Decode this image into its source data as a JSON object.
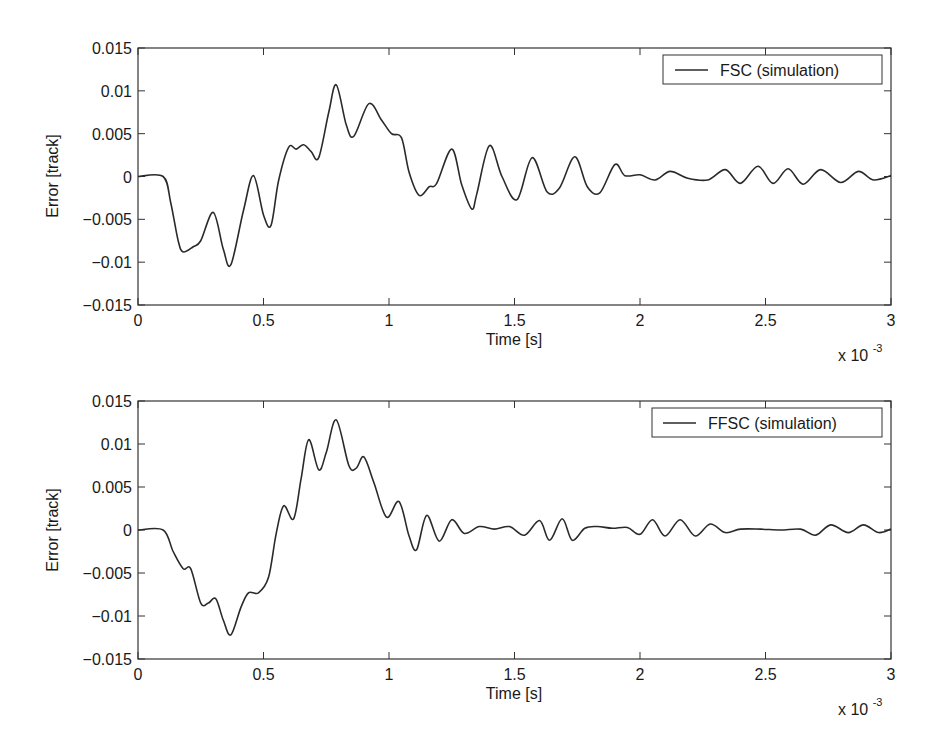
{
  "figure": {
    "background": "#ffffff",
    "line_color": "#2a2a2a",
    "axis_color": "#333333"
  },
  "chart_data": [
    {
      "type": "line",
      "title": "",
      "xlabel": "Time [s]",
      "ylabel": "Error [track]",
      "x_multiplier_label": "x 10",
      "x_multiplier_exp": "-3",
      "xlim": [
        0,
        3
      ],
      "ylim": [
        -0.015,
        0.015
      ],
      "xticks": [
        0,
        0.5,
        1,
        1.5,
        2,
        2.5,
        3
      ],
      "xtick_labels": [
        "0",
        "0.5",
        "1",
        "1.5",
        "2",
        "2.5",
        "3"
      ],
      "yticks": [
        0.015,
        0.01,
        0.005,
        0,
        -0.005,
        -0.01,
        -0.015
      ],
      "ytick_labels": [
        "0.015",
        "0.01",
        "0.005",
        "0",
        "−0.005",
        "−0.01",
        "−0.015"
      ],
      "grid": false,
      "legend_position": "upper right",
      "series": [
        {
          "name": "FSC (simulation)",
          "x": [
            0,
            0.1,
            0.13,
            0.16,
            0.18,
            0.22,
            0.25,
            0.3,
            0.34,
            0.37,
            0.42,
            0.46,
            0.5,
            0.53,
            0.56,
            0.6,
            0.63,
            0.66,
            0.69,
            0.72,
            0.76,
            0.79,
            0.83,
            0.86,
            0.92,
            0.97,
            1.01,
            1.05,
            1.08,
            1.12,
            1.16,
            1.19,
            1.25,
            1.29,
            1.33,
            1.35,
            1.4,
            1.45,
            1.51,
            1.57,
            1.63,
            1.68,
            1.74,
            1.79,
            1.84,
            1.9,
            1.94,
            2.0,
            2.06,
            2.12,
            2.19,
            2.27,
            2.34,
            2.4,
            2.47,
            2.53,
            2.59,
            2.65,
            2.72,
            2.8,
            2.87,
            2.93,
            3.0
          ],
          "y": [
            0,
            0,
            -0.003,
            -0.0075,
            -0.0088,
            -0.0082,
            -0.0075,
            -0.0042,
            -0.0085,
            -0.0103,
            -0.004,
            0.0001,
            -0.0045,
            -0.0057,
            -0.0005,
            0.0034,
            0.0032,
            0.0037,
            0.0029,
            0.0022,
            0.0075,
            0.0107,
            0.006,
            0.0047,
            0.0085,
            0.0066,
            0.005,
            0.0045,
            0.0005,
            -0.0022,
            -0.0012,
            -0.0008,
            0.0032,
            -0.001,
            -0.0038,
            -0.002,
            0.0036,
            0.0,
            -0.0027,
            0.0022,
            -0.0018,
            -0.0013,
            0.0023,
            -0.0012,
            -0.0019,
            0.0014,
            0.0001,
            0.0002,
            -0.0004,
            0.0006,
            -0.0002,
            -0.0004,
            0.0008,
            -0.0008,
            0.0012,
            -0.0008,
            0.0009,
            -0.0009,
            0.0008,
            -0.0007,
            0.0006,
            -0.0004,
            0.0001
          ]
        }
      ]
    },
    {
      "type": "line",
      "title": "",
      "xlabel": "Time [s]",
      "ylabel": "Error [track]",
      "x_multiplier_label": "x 10",
      "x_multiplier_exp": "-3",
      "xlim": [
        0,
        3
      ],
      "ylim": [
        -0.015,
        0.015
      ],
      "xticks": [
        0,
        0.5,
        1,
        1.5,
        2,
        2.5,
        3
      ],
      "xtick_labels": [
        "0",
        "0.5",
        "1",
        "1.5",
        "2",
        "2.5",
        "3"
      ],
      "yticks": [
        0.015,
        0.01,
        0.005,
        0,
        -0.005,
        -0.01,
        -0.015
      ],
      "ytick_labels": [
        "0.015",
        "0.01",
        "0.005",
        "0",
        "−0.005",
        "−0.01",
        "−0.015"
      ],
      "grid": false,
      "legend_position": "upper right",
      "series": [
        {
          "name": "FFSC (simulation)",
          "x": [
            0,
            0.1,
            0.14,
            0.18,
            0.21,
            0.25,
            0.28,
            0.31,
            0.34,
            0.37,
            0.41,
            0.44,
            0.48,
            0.52,
            0.55,
            0.58,
            0.62,
            0.65,
            0.68,
            0.72,
            0.75,
            0.79,
            0.84,
            0.87,
            0.9,
            0.94,
            0.99,
            1.04,
            1.08,
            1.11,
            1.15,
            1.2,
            1.25,
            1.3,
            1.36,
            1.42,
            1.48,
            1.54,
            1.6,
            1.64,
            1.69,
            1.73,
            1.78,
            1.83,
            1.89,
            1.95,
            2.0,
            2.05,
            2.1,
            2.16,
            2.22,
            2.28,
            2.34,
            2.4,
            2.48,
            2.56,
            2.64,
            2.7,
            2.76,
            2.83,
            2.89,
            2.95,
            3.0
          ],
          "y": [
            0,
            0,
            -0.0025,
            -0.0045,
            -0.0045,
            -0.0085,
            -0.0085,
            -0.008,
            -0.0105,
            -0.0122,
            -0.009,
            -0.0073,
            -0.0073,
            -0.0055,
            -0.0005,
            0.0028,
            0.0013,
            0.006,
            0.0105,
            0.007,
            0.009,
            0.0128,
            0.0075,
            0.0072,
            0.0085,
            0.0055,
            0.0015,
            0.0033,
            -0.0007,
            -0.0023,
            0.0017,
            -0.0013,
            0.0012,
            -0.0004,
            0.0004,
            0.0001,
            0.0004,
            -0.0006,
            0.0011,
            -0.0012,
            0.0013,
            -0.0012,
            0.0002,
            0.0004,
            0.0002,
            0.0003,
            -0.0005,
            0.0012,
            -0.0007,
            0.0012,
            -0.0007,
            0.0007,
            -0.0003,
            0.0001,
            0.0001,
            0.0,
            0.0001,
            -0.0006,
            0.0006,
            -0.0003,
            0.0006,
            -0.0003,
            0.0001
          ]
        }
      ]
    }
  ]
}
